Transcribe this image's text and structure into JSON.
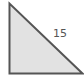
{
  "diagram": {
    "shape": "right-triangle",
    "right_angle_vertex": "bottom-left",
    "hypotenuse_label": "15",
    "colors": {
      "fill": "#e2e2e2",
      "stroke": "#555555",
      "label": "#555555"
    }
  }
}
